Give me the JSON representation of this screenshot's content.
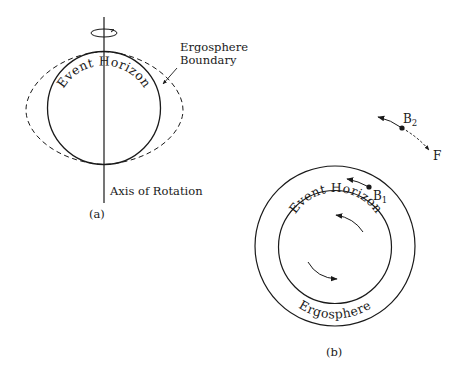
{
  "figure_a": {
    "label": "(a)",
    "event_horizon_label": "Event Horizon",
    "ergosphere_boundary_label_line1": "Ergosphere",
    "ergosphere_boundary_label_line2": "Boundary",
    "axis_label": "Axis of Rotation"
  },
  "figure_b": {
    "label": "(b)",
    "event_horizon_label": "Event Horizon",
    "ergosphere_label": "Ergosphere",
    "body1": "B",
    "body1_sub": "1",
    "body2": "B",
    "body2_sub": "2",
    "force_label": "F"
  },
  "colors": {
    "stroke": "#1a1a1a",
    "background": "#ffffff"
  }
}
